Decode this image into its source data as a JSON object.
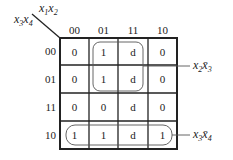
{
  "kmap": {
    "col_var": "x1x2",
    "row_var": "x3x4",
    "col_headers": [
      "00",
      "01",
      "11",
      "10"
    ],
    "row_headers": [
      "00",
      "01",
      "11",
      "10"
    ],
    "cells": [
      [
        "0",
        "1",
        "d",
        "0"
      ],
      [
        "0",
        "1",
        "d",
        "0"
      ],
      [
        "0",
        "0",
        "d",
        "0"
      ],
      [
        "1",
        "1",
        "d",
        "1"
      ]
    ],
    "groups": [
      {
        "label": "x2x̄3",
        "rows": [
          0,
          1
        ],
        "cols": [
          1,
          2
        ]
      },
      {
        "label": "x3x̄4",
        "rows": [
          3
        ],
        "cols": [
          0,
          1,
          2,
          3
        ]
      }
    ]
  }
}
